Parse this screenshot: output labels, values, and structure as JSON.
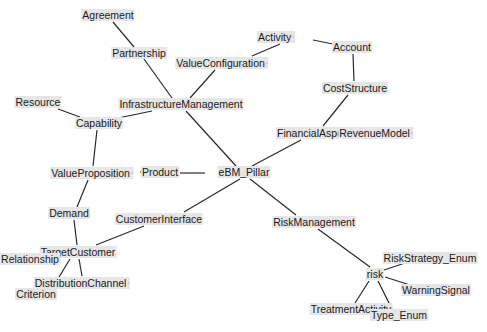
{
  "diagram": {
    "type": "concept-graph",
    "nodes": [
      {
        "id": "agreement",
        "label": "Agreement",
        "x": 108,
        "y": 15,
        "mark": ""
      },
      {
        "id": "partnership",
        "label": "Partnership",
        "x": 139,
        "y": 53,
        "mark": ""
      },
      {
        "id": "valueconfiguration",
        "label": "ValueConfiguration",
        "x": 222,
        "y": 63,
        "mark": "▫"
      },
      {
        "id": "activity",
        "label": "Activity",
        "x": 276,
        "y": 37,
        "mark": "▫"
      },
      {
        "id": "account",
        "label": "Account",
        "x": 352,
        "y": 47,
        "mark": ""
      },
      {
        "id": "coststructure",
        "label": "CostStructure",
        "x": 355,
        "y": 88,
        "mark": ""
      },
      {
        "id": "infrastructuremanagement",
        "label": "InfrastructureManagement",
        "x": 181,
        "y": 104,
        "mark": ""
      },
      {
        "id": "resource",
        "label": "Resource",
        "x": 38,
        "y": 102,
        "mark": ""
      },
      {
        "id": "capability",
        "label": "Capability",
        "x": 99,
        "y": 123,
        "mark": ""
      },
      {
        "id": "financialaspe",
        "label": "FinancialAspe",
        "x": 310,
        "y": 133,
        "mark": ""
      },
      {
        "id": "revenuemodel",
        "label": "RevenueModel",
        "x": 376,
        "y": 133,
        "mark": "▫"
      },
      {
        "id": "valueproposition",
        "label": "ValueProposition",
        "x": 92,
        "y": 173,
        "mark": "▫"
      },
      {
        "id": "product",
        "label": "Product",
        "x": 160,
        "y": 172,
        "mark": ""
      },
      {
        "id": "ebm_pillar",
        "label": "eBM_Pillar",
        "x": 244,
        "y": 172,
        "mark": ""
      },
      {
        "id": "demand",
        "label": "Demand",
        "x": 69,
        "y": 213,
        "mark": ""
      },
      {
        "id": "customerinterface",
        "label": "CustomerInterface",
        "x": 159,
        "y": 219,
        "mark": ""
      },
      {
        "id": "riskmanagement",
        "label": "RiskManagement",
        "x": 314,
        "y": 222,
        "mark": ""
      },
      {
        "id": "targetcustomer",
        "label": "TargetCustomer",
        "x": 78,
        "y": 252,
        "mark": ""
      },
      {
        "id": "relationship",
        "label": "Relationship",
        "x": 30,
        "y": 259,
        "mark": ""
      },
      {
        "id": "distributionchannel",
        "label": "DistributionChannel",
        "x": 82,
        "y": 283,
        "mark": "▫"
      },
      {
        "id": "criterion",
        "label": "Criterion",
        "x": 36,
        "y": 294,
        "mark": ""
      },
      {
        "id": "riskstrategy_enum",
        "label": "RiskStrategy_Enum",
        "x": 430,
        "y": 258,
        "mark": ""
      },
      {
        "id": "risk",
        "label": "risk",
        "x": 375,
        "y": 274,
        "mark": ""
      },
      {
        "id": "warningsignal",
        "label": "WarningSignal",
        "x": 436,
        "y": 290,
        "mark": ""
      },
      {
        "id": "treatmentactivity",
        "label": "TreatmentActivity",
        "x": 351,
        "y": 309,
        "mark": ""
      },
      {
        "id": "type_enum",
        "label": "Type_Enum",
        "x": 399,
        "y": 315,
        "mark": ""
      }
    ],
    "edges": [
      {
        "from": "agreement",
        "to": "partnership",
        "x1": 113,
        "y1": 22,
        "x2": 134,
        "y2": 47
      },
      {
        "from": "partnership",
        "to": "infrastructuremanagement",
        "x1": 144,
        "y1": 59,
        "x2": 172,
        "y2": 98
      },
      {
        "from": "valueconfiguration",
        "to": "infrastructuremanagement",
        "x1": 215,
        "y1": 70,
        "x2": 190,
        "y2": 98
      },
      {
        "from": "valueconfiguration",
        "to": "activity",
        "x1": 252,
        "y1": 56,
        "x2": 280,
        "y2": 44
      },
      {
        "from": "activity",
        "to": "account",
        "x1": 313,
        "y1": 40,
        "x2": 333,
        "y2": 44
      },
      {
        "from": "account",
        "to": "coststructure",
        "x1": 353,
        "y1": 54,
        "x2": 354,
        "y2": 81
      },
      {
        "from": "coststructure",
        "to": "financialaspe",
        "x1": 348,
        "y1": 95,
        "x2": 323,
        "y2": 126
      },
      {
        "from": "financialaspe",
        "to": "ebm_pillar",
        "x1": 301,
        "y1": 140,
        "x2": 252,
        "y2": 166
      },
      {
        "from": "resource",
        "to": "capability",
        "x1": 58,
        "y1": 109,
        "x2": 80,
        "y2": 117
      },
      {
        "from": "capability",
        "to": "infrastructuremanagement",
        "x1": 118,
        "y1": 118,
        "x2": 152,
        "y2": 111
      },
      {
        "from": "infrastructuremanagement",
        "to": "ebm_pillar",
        "x1": 186,
        "y1": 111,
        "x2": 236,
        "y2": 166
      },
      {
        "from": "capability",
        "to": "valueproposition",
        "x1": 97,
        "y1": 130,
        "x2": 93,
        "y2": 166
      },
      {
        "from": "valueproposition",
        "to": "product",
        "x1": 140,
        "y1": 172,
        "x2": 145,
        "y2": 172
      },
      {
        "from": "product",
        "to": "ebm_pillar",
        "x1": 180,
        "y1": 173,
        "x2": 205,
        "y2": 173
      },
      {
        "from": "valueproposition",
        "to": "demand",
        "x1": 88,
        "y1": 180,
        "x2": 77,
        "y2": 207
      },
      {
        "from": "ebm_pillar",
        "to": "customerinterface",
        "x1": 240,
        "y1": 179,
        "x2": 184,
        "y2": 212
      },
      {
        "from": "ebm_pillar",
        "to": "riskmanagement",
        "x1": 250,
        "y1": 179,
        "x2": 296,
        "y2": 215
      },
      {
        "from": "demand",
        "to": "targetcustomer",
        "x1": 74,
        "y1": 220,
        "x2": 77,
        "y2": 245
      },
      {
        "from": "customerinterface",
        "to": "targetcustomer",
        "x1": 144,
        "y1": 226,
        "x2": 96,
        "y2": 245
      },
      {
        "from": "targetcustomer",
        "to": "criterion",
        "x1": 70,
        "y1": 259,
        "x2": 53,
        "y2": 287
      },
      {
        "from": "targetcustomer",
        "to": "distributionchannel",
        "x1": 79,
        "y1": 259,
        "x2": 82,
        "y2": 276
      },
      {
        "from": "riskmanagement",
        "to": "risk",
        "x1": 318,
        "y1": 229,
        "x2": 370,
        "y2": 267
      },
      {
        "from": "risk",
        "to": "riskstrategy_enum",
        "x1": 384,
        "y1": 270,
        "x2": 405,
        "y2": 263
      },
      {
        "from": "risk",
        "to": "warningsignal",
        "x1": 385,
        "y1": 277,
        "x2": 410,
        "y2": 285
      },
      {
        "from": "risk",
        "to": "treatmentactivity",
        "x1": 369,
        "y1": 281,
        "x2": 355,
        "y2": 303
      },
      {
        "from": "risk",
        "to": "type_enum",
        "x1": 378,
        "y1": 281,
        "x2": 392,
        "y2": 309
      }
    ]
  }
}
